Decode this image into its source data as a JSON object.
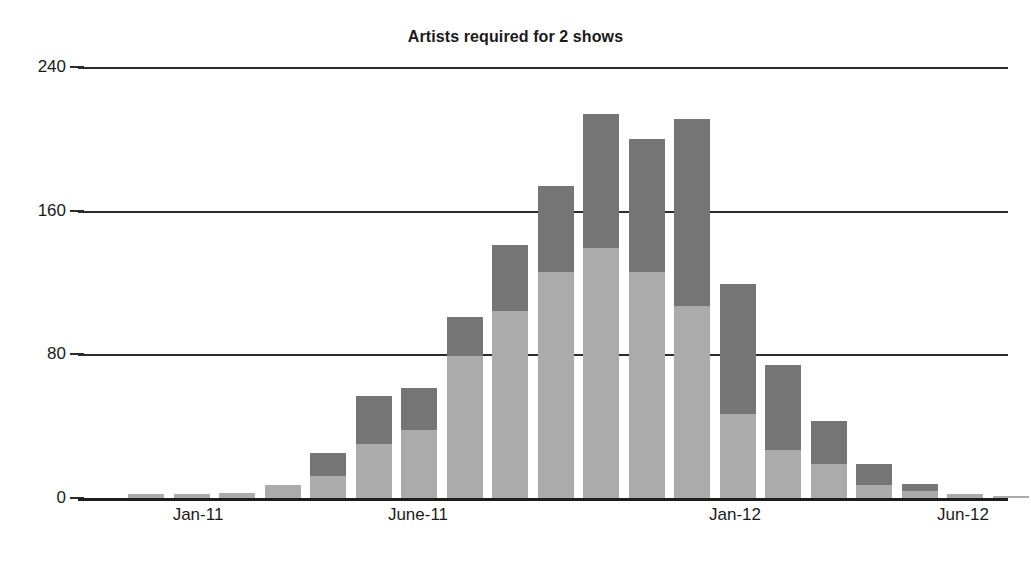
{
  "chart_data": {
    "type": "bar",
    "subtype": "stacked-column",
    "title": "Artists required for 2 shows",
    "xlabel": "",
    "ylabel": "",
    "ylim": [
      0,
      240
    ],
    "yticks": [
      0,
      80,
      160,
      240
    ],
    "ytick_labels": [
      "0",
      "80",
      "160",
      "240"
    ],
    "grid": true,
    "grid_axis": "y",
    "legend": false,
    "legend_position": "none",
    "categories": [
      "Nov-10",
      "Dec-10",
      "Jan-11",
      "Feb-11",
      "Mar-11",
      "Apr-11",
      "May-11",
      "June-11",
      "July-11",
      "Aug-11",
      "Sep-11",
      "Oct-11",
      "Nov-11",
      "Dec-11",
      "Jan-12",
      "Feb-12",
      "Mar-12",
      "Apr-12",
      "May-12",
      "Jun-12"
    ],
    "xtick_labels": [
      "Jan-11",
      "June-11",
      "Jan-12",
      "Jun-12"
    ],
    "series": [
      {
        "name": "Show 1",
        "color": "#ababab",
        "values": [
          2,
          2,
          3,
          7,
          12,
          30,
          38,
          79,
          104,
          126,
          139,
          126,
          107,
          47,
          27,
          19,
          7,
          4,
          2,
          1
        ]
      },
      {
        "name": "Show 2",
        "color": "#757575",
        "values": [
          0,
          0,
          0,
          0,
          13,
          27,
          23,
          22,
          37,
          48,
          75,
          74,
          104,
          72,
          47,
          24,
          12,
          4,
          0,
          0
        ]
      }
    ],
    "totals": [
      2,
      2,
      3,
      7,
      25,
      57,
      61,
      101,
      141,
      174,
      214,
      200,
      211,
      119,
      74,
      43,
      19,
      8,
      2,
      1
    ],
    "colors": {
      "series_light": "#ababab",
      "series_dark": "#757575",
      "axis": "#1d1d1d",
      "gridline": "#2b2b2b",
      "background": "#ffffff",
      "text": "#1a1a1a"
    }
  },
  "layout": {
    "plot_left_px": 78,
    "plot_top_px": 67,
    "plot_width_px": 930,
    "plot_height_px": 431,
    "bar_width_px": 36,
    "bar_pitch_px": 45.5,
    "first_bar_left_px": 50,
    "xtick_x_px": [
      198,
      418,
      735,
      963
    ]
  }
}
